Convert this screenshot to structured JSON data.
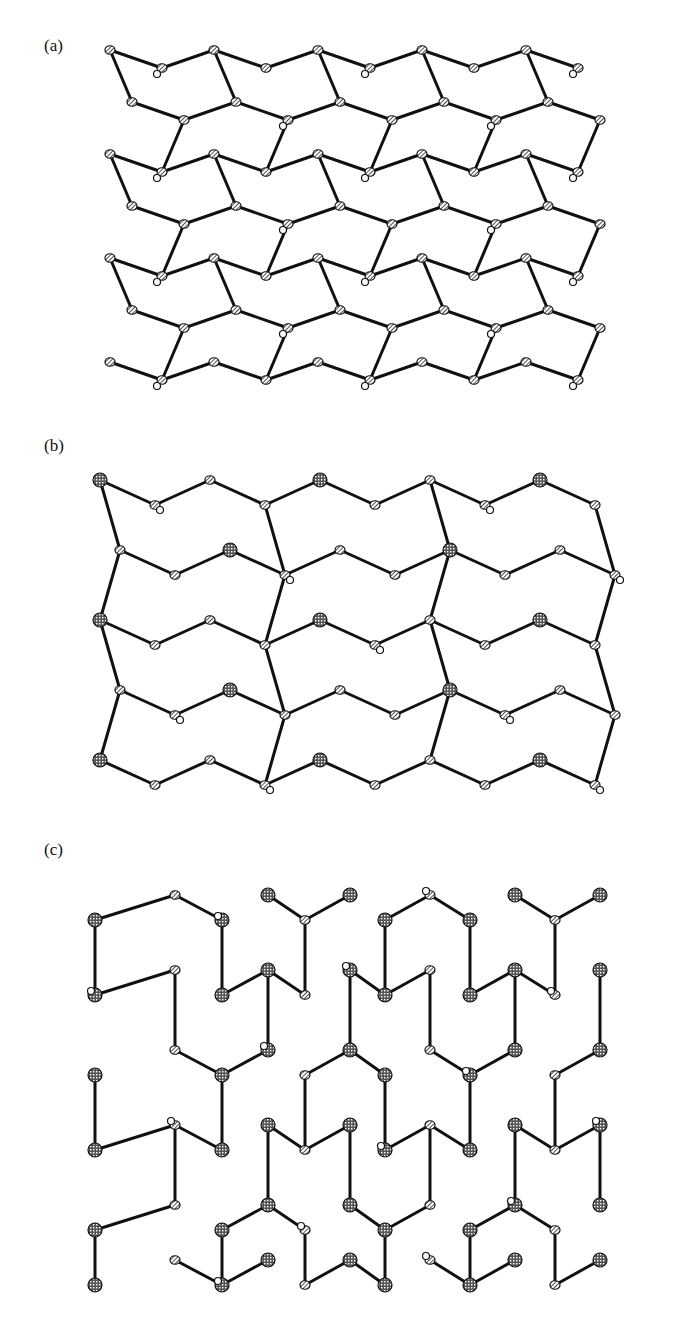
{
  "figure": {
    "panels": [
      {
        "id": "a",
        "label": "(a)",
        "description": "Dense framework with pentagon-like rings and four-membered rings, hatched atoms"
      },
      {
        "id": "b",
        "label": "(b)",
        "description": "Layered framework of elongated hexagonal rings linked by four-membered rings"
      },
      {
        "id": "c",
        "label": "(c)",
        "description": "Honeycomb-like framework with cross-hatched and hatched atoms and open atoms"
      }
    ]
  },
  "legend_styles": {
    "bond_color": "#111111",
    "atom_hatched": "hatched ellipsoid",
    "atom_crosshatched": "cross-hatched sphere",
    "atom_open": "open circle"
  }
}
